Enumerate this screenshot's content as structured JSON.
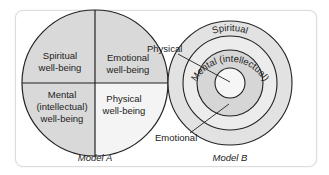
{
  "model_a": {
    "caption": "Model A",
    "quadrants": [
      {
        "position": "top-left",
        "line1": "Spiritual",
        "line2": "well-being",
        "line3": "",
        "fill": "#d9d9d9"
      },
      {
        "position": "top-right",
        "line1": "Emotional",
        "line2": "well-being",
        "line3": "",
        "fill": "#d9d9d9"
      },
      {
        "position": "bottom-left",
        "line1": "Mental",
        "line2": "(intellectual)",
        "line3": "well-being",
        "fill": "#d9d9d9"
      },
      {
        "position": "bottom-right",
        "line1": "Physical",
        "line2": "well-being",
        "line3": "",
        "fill": "#f4f4f4"
      }
    ]
  },
  "model_b": {
    "caption": "Model B",
    "rings": [
      {
        "label": "Spiritual",
        "fill": "#e2e2e2"
      },
      {
        "label": "Mental (intellectual)",
        "fill": "#ececec"
      },
      {
        "label": "Emotional",
        "fill": "#d6d6d6"
      },
      {
        "label": "Physical",
        "fill": "#f6f6f6"
      }
    ],
    "callouts": {
      "physical": "Physical",
      "emotional": "Emotional"
    }
  }
}
